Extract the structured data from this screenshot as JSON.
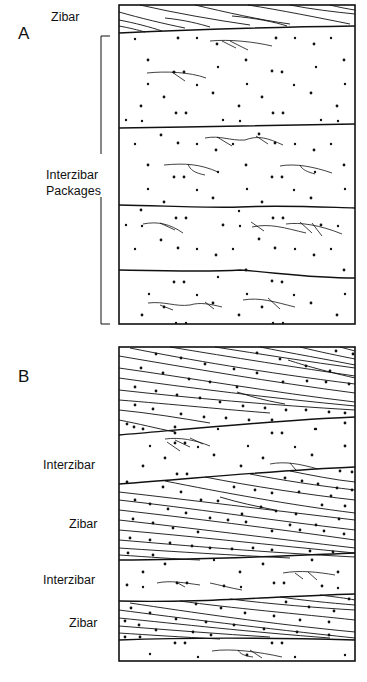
{
  "figure": {
    "panels": [
      {
        "id": "A",
        "letter": "A",
        "labels": [
          {
            "text": "Zibar",
            "x": 51,
            "y": 10
          },
          {
            "text": "Interzibar",
            "x": 46,
            "y": 169
          },
          {
            "text": "Packages",
            "x": 46,
            "y": 185
          }
        ],
        "bracket_label": "Interzibar Packages",
        "layers": [
          "Zibar",
          "Interzibar package",
          "Interzibar package",
          "Interzibar package",
          "Interzibar package"
        ]
      },
      {
        "id": "B",
        "letter": "B",
        "labels": [
          {
            "text": "Interzibar",
            "x": 43,
            "y": 459
          },
          {
            "text": "Zibar",
            "x": 69,
            "y": 518
          },
          {
            "text": "Interzibar",
            "x": 43,
            "y": 574
          },
          {
            "text": "Zibar",
            "x": 69,
            "y": 617
          }
        ],
        "layers": [
          "Zibar",
          "Interzibar",
          "Zibar",
          "Interzibar",
          "Zibar",
          "Interzibar"
        ]
      }
    ],
    "colors": {
      "ink": "#111111",
      "background": "#ffffff"
    }
  }
}
